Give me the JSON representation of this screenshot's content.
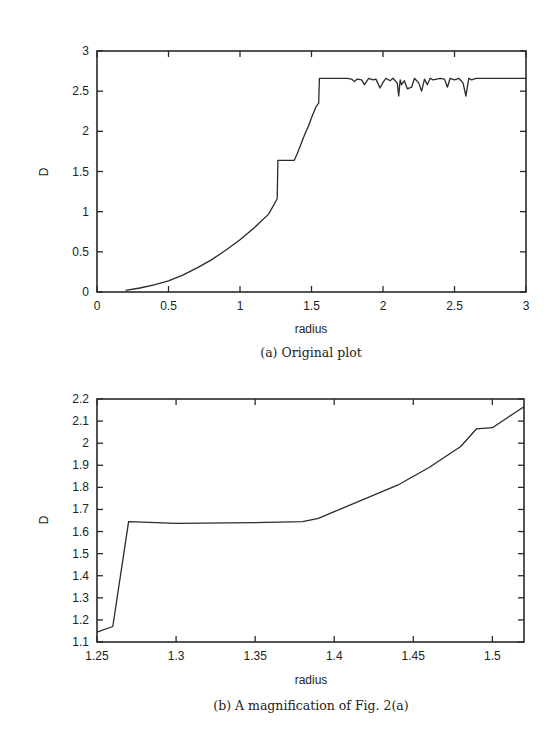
{
  "chart_data": [
    {
      "type": "line",
      "title": "",
      "caption": "(a) Original plot",
      "xlabel": "radius",
      "ylabel": "D",
      "xlim": [
        0,
        3
      ],
      "ylim": [
        0,
        3
      ],
      "grid": false,
      "legend": null,
      "xticks": [
        "0",
        "0.5",
        "1",
        "1.5",
        "2",
        "2.5",
        "3"
      ],
      "yticks": [
        "0",
        "0.5",
        "1",
        "1.5",
        "2",
        "2.5",
        "3"
      ],
      "series": [
        {
          "name": "D(radius)",
          "x": [
            0.2,
            0.3,
            0.4,
            0.5,
            0.6,
            0.7,
            0.8,
            0.9,
            1.0,
            1.1,
            1.2,
            1.26,
            1.265,
            1.27,
            1.3,
            1.38,
            1.4,
            1.45,
            1.48,
            1.5,
            1.53,
            1.55,
            1.555,
            1.6,
            1.7,
            1.75,
            1.78,
            1.8,
            1.82,
            1.85,
            1.87,
            1.9,
            1.93,
            1.95,
            1.98,
            2.0,
            2.02,
            2.05,
            2.07,
            2.1,
            2.11,
            2.12,
            2.13,
            2.15,
            2.17,
            2.2,
            2.22,
            2.25,
            2.27,
            2.29,
            2.31,
            2.33,
            2.35,
            2.4,
            2.43,
            2.45,
            2.47,
            2.5,
            2.53,
            2.56,
            2.58,
            2.6,
            2.62,
            2.65,
            2.7,
            2.8,
            3.0
          ],
          "y": [
            0.02,
            0.05,
            0.09,
            0.14,
            0.21,
            0.3,
            0.4,
            0.52,
            0.65,
            0.8,
            0.97,
            1.16,
            1.64,
            1.64,
            1.64,
            1.64,
            1.72,
            1.95,
            2.07,
            2.17,
            2.3,
            2.35,
            2.66,
            2.66,
            2.66,
            2.66,
            2.65,
            2.62,
            2.65,
            2.64,
            2.58,
            2.66,
            2.64,
            2.65,
            2.54,
            2.61,
            2.66,
            2.63,
            2.66,
            2.6,
            2.44,
            2.64,
            2.58,
            2.63,
            2.53,
            2.55,
            2.66,
            2.6,
            2.5,
            2.65,
            2.58,
            2.66,
            2.64,
            2.66,
            2.65,
            2.55,
            2.66,
            2.64,
            2.66,
            2.6,
            2.44,
            2.66,
            2.64,
            2.66,
            2.66,
            2.66,
            2.66
          ]
        }
      ]
    },
    {
      "type": "line",
      "title": "",
      "caption": "(b) A magnification of Fig. 2(a)",
      "xlabel": "radius",
      "ylabel": "D",
      "xlim": [
        1.25,
        1.52
      ],
      "ylim": [
        1.1,
        2.2
      ],
      "grid": false,
      "legend": null,
      "xticks": [
        "1.25",
        "1.3",
        "1.35",
        "1.4",
        "1.45",
        "1.5"
      ],
      "yticks": [
        "1.1",
        "1.2",
        "1.3",
        "1.4",
        "1.5",
        "1.6",
        "1.7",
        "1.8",
        "1.9",
        "2",
        "2.1",
        "2.2"
      ],
      "series": [
        {
          "name": "D(radius)",
          "x": [
            1.25,
            1.26,
            1.27,
            1.3,
            1.35,
            1.38,
            1.39,
            1.4,
            1.44,
            1.46,
            1.48,
            1.49,
            1.5,
            1.52
          ],
          "y": [
            1.145,
            1.17,
            1.645,
            1.637,
            1.64,
            1.645,
            1.66,
            1.69,
            1.81,
            1.89,
            1.985,
            2.065,
            2.07,
            2.165
          ]
        }
      ]
    }
  ],
  "figure": {
    "plot_a": {
      "ylabel": "D",
      "xlabel": "radius",
      "caption": "(a) Original plot",
      "yticks": [
        "0",
        "0.5",
        "1",
        "1.5",
        "2",
        "2.5",
        "3"
      ],
      "xticks": [
        "0",
        "0.5",
        "1",
        "1.5",
        "2",
        "2.5",
        "3"
      ]
    },
    "plot_b": {
      "ylabel": "D",
      "xlabel": "radius",
      "caption": "(b) A magnification of Fig. 2(a)",
      "yticks": [
        "1.1",
        "1.2",
        "1.3",
        "1.4",
        "1.5",
        "1.6",
        "1.7",
        "1.8",
        "1.9",
        "2",
        "2.1",
        "2.2"
      ],
      "xticks": [
        "1.25",
        "1.3",
        "1.35",
        "1.4",
        "1.45",
        "1.5"
      ]
    }
  },
  "colors": {
    "line": "#2a2a2a",
    "axis": "#2a2a2a",
    "text": "#222222",
    "background": "#ffffff"
  }
}
